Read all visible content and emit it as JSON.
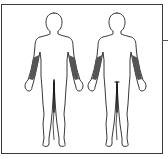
{
  "diagram": {
    "type": "body-chart",
    "views": [
      {
        "id": "front",
        "label": "",
        "shaded_regions": [
          "left-forearm",
          "right-forearm"
        ]
      },
      {
        "id": "back",
        "label": "",
        "shaded_regions": [
          "left-forearm",
          "right-forearm"
        ]
      }
    ],
    "colors": {
      "outline": "#222222",
      "shade": "#555555",
      "border": "#3a3a3a",
      "background": "#ffffff"
    }
  }
}
